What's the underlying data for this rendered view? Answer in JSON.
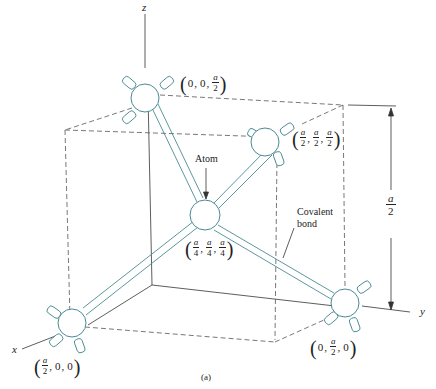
{
  "figure": {
    "caption": "(a)",
    "axes": {
      "x": "x",
      "y": "y",
      "z": "z"
    },
    "annotations": {
      "atom": "Atom",
      "covalent_bond_line1": "Covalent",
      "covalent_bond_line2": "bond",
      "dimension_numerator": "a",
      "dimension_denominator": "2"
    },
    "atoms": [
      {
        "name": "top",
        "coords": [
          "0",
          "0",
          "a/2"
        ]
      },
      {
        "name": "upper-right",
        "coords": [
          "a/2",
          "a/2",
          "a/2"
        ]
      },
      {
        "name": "center",
        "coords": [
          "a/4",
          "a/4",
          "a/4"
        ]
      },
      {
        "name": "front-left",
        "coords": [
          "a/2",
          "0",
          "0"
        ]
      },
      {
        "name": "bottom-right",
        "coords": [
          "0",
          "a/2",
          "0"
        ]
      }
    ],
    "fraction_parts": {
      "a": "a",
      "two": "2",
      "four": "4",
      "zero": "0",
      "comma": ","
    },
    "colors": {
      "atom_outline": "#4a8a94",
      "line": "#333333",
      "dashed": "#555555"
    }
  }
}
